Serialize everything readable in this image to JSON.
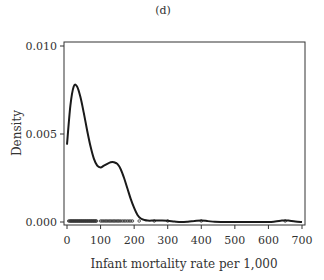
{
  "chart_data": {
    "type": "line",
    "title": "(d)",
    "xlabel": "Infant mortality rate per 1,000",
    "ylabel": "Density",
    "xlim": [
      0,
      700
    ],
    "ylim": [
      0,
      0.01
    ],
    "xticks": [
      0,
      100,
      200,
      300,
      400,
      500,
      600,
      700
    ],
    "xtick_labels": [
      "0",
      "100",
      "200",
      "300",
      "400",
      "500",
      "600",
      "700"
    ],
    "yticks": [
      0,
      0.005,
      0.01
    ],
    "ytick_labels": [
      "0.000",
      "0.005",
      "0.010"
    ],
    "grid": false,
    "series": [
      {
        "name": "density",
        "x": [
          0,
          10,
          20,
          30,
          40,
          50,
          60,
          70,
          80,
          90,
          100,
          110,
          120,
          130,
          140,
          150,
          160,
          170,
          180,
          190,
          200,
          210,
          220,
          230,
          240,
          260,
          280,
          300,
          320,
          340,
          360,
          380,
          400,
          420,
          440,
          460,
          500,
          550,
          600,
          620,
          640,
          650,
          660,
          680,
          700
        ],
        "y": [
          0.0044,
          0.0066,
          0.0077,
          0.0077,
          0.0071,
          0.0062,
          0.0052,
          0.0043,
          0.0036,
          0.0032,
          0.0031,
          0.0032,
          0.0033,
          0.0034,
          0.0034,
          0.0033,
          0.003,
          0.0025,
          0.0019,
          0.0013,
          0.0008,
          0.0004,
          0.0002,
          0.00012,
          8e-05,
          8e-05,
          8e-05,
          7e-05,
          3e-05,
          0.0,
          2e-05,
          6e-05,
          9e-05,
          5e-05,
          1e-05,
          0.0,
          0.0,
          0.0,
          0.0,
          3e-05,
          8e-05,
          9e-05,
          8e-05,
          3e-05,
          0.0
        ]
      }
    ],
    "rug": [
      5,
      8,
      10,
      12,
      14,
      16,
      18,
      20,
      22,
      24,
      26,
      28,
      30,
      32,
      34,
      36,
      38,
      40,
      42,
      44,
      46,
      48,
      50,
      52,
      54,
      56,
      58,
      60,
      62,
      64,
      66,
      68,
      70,
      72,
      74,
      76,
      78,
      80,
      82,
      84,
      86,
      88,
      100,
      104,
      108,
      112,
      116,
      120,
      124,
      128,
      132,
      136,
      140,
      144,
      148,
      152,
      156,
      160,
      165,
      170,
      175,
      180,
      185,
      190,
      195,
      215,
      260,
      300,
      400,
      650
    ]
  }
}
